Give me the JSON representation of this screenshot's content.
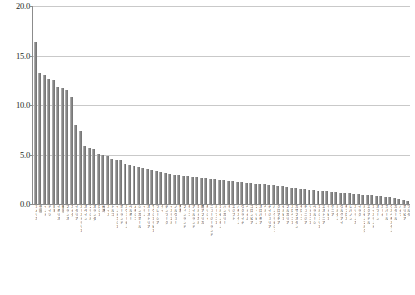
{
  "chart_data": {
    "type": "bar",
    "title": "",
    "subtitle": "",
    "xlabel": "",
    "ylabel": "",
    "ylim": [
      0.0,
      20.0
    ],
    "yticks": [
      "0.0",
      "5.0",
      "10.0",
      "15.0",
      "20.0"
    ],
    "ytick_values": [
      0.0,
      5.0,
      10.0,
      15.0,
      20.0
    ],
    "grid": true,
    "legend": "none",
    "bar_color": "#808080",
    "grid_color": "#c9c9c9",
    "axis_color": "#8c8c8c",
    "categories": [
      "アメリカ",
      "中国",
      "インド",
      "ドイツ",
      "日本",
      "イギリス",
      "韓国",
      "フランス",
      "カナダ",
      "イタリア",
      "オーストラリア",
      "スペイン",
      "ブラジル",
      "オランダ",
      "ロシア",
      "台湾",
      "スイス",
      "トルコ",
      "インドネシア",
      "ポーランド",
      "スウェーデン",
      "ベルギー",
      "メキシコ",
      "シンガポール",
      "イラン",
      "オーストリア",
      "サウジアラビア",
      "マレーシア",
      "タイ",
      "デンマーク",
      "イスラエル",
      "ノルウェー",
      "香港",
      "フィンランド",
      "チェコ",
      "アイルランド",
      "ポルトガル",
      "南アフリカ",
      "ギリシャ",
      "ニュージーランド",
      "ルーマニア",
      "アルゼンチン",
      "ハンガリー",
      "チリ",
      "エジプト",
      "パキスタン",
      "ウクライナ",
      "ベトナム",
      "コロンビア",
      "フィリピン",
      "スロバキア",
      "ペルー",
      "ナイジェリア",
      "バングラデシュ",
      "クロアチア",
      "セルビア",
      "ブルガリア",
      "スロベニア",
      "カザフスタン",
      "モロッコ",
      "チュニジア",
      "リトアニア",
      "ベラルーシ",
      "アルジェリア",
      "エストニア",
      "ラトビア",
      "ケニア",
      "ヨルダン",
      "ウルグアイ",
      "キプロス",
      "レバノン",
      "スリランカ",
      "イラク",
      "ルクセンブルク",
      "エクアドル",
      "アイスランド",
      "オマーン",
      "ガーナ",
      "ネパール",
      "ウズベキスタン",
      "カタール",
      "パナマ",
      "ボリビア",
      "マルタ"
    ],
    "values": [
      16.4,
      13.2,
      13.0,
      12.6,
      12.5,
      11.8,
      11.7,
      11.5,
      10.8,
      8.0,
      7.4,
      5.9,
      5.7,
      5.6,
      5.1,
      5.0,
      4.8,
      4.5,
      4.4,
      4.4,
      4.0,
      3.9,
      3.8,
      3.7,
      3.6,
      3.5,
      3.4,
      3.3,
      3.2,
      3.1,
      3.0,
      2.9,
      2.9,
      2.8,
      2.8,
      2.7,
      2.7,
      2.6,
      2.6,
      2.5,
      2.5,
      2.4,
      2.4,
      2.3,
      2.3,
      2.2,
      2.2,
      2.1,
      2.1,
      2.0,
      2.0,
      2.0,
      1.9,
      1.9,
      1.8,
      1.8,
      1.7,
      1.6,
      1.6,
      1.5,
      1.5,
      1.4,
      1.4,
      1.3,
      1.3,
      1.3,
      1.2,
      1.2,
      1.1,
      1.1,
      1.1,
      1.0,
      1.0,
      0.9,
      0.9,
      0.9,
      0.8,
      0.8,
      0.7,
      0.7,
      0.6,
      0.5,
      0.4,
      0.3
    ]
  }
}
